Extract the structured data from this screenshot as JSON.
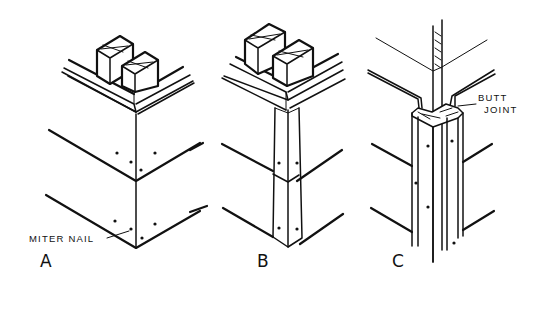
{
  "figure": {
    "type": "technical-illustration"
  },
  "panels": [
    {
      "id": "A",
      "label": "A",
      "callout": "MITER NAIL"
    },
    {
      "id": "B",
      "label": "B"
    },
    {
      "id": "C",
      "label": "C",
      "callout_line1": "BUTT",
      "callout_line2": "JOINT"
    }
  ],
  "colors": {
    "ink": "#111111",
    "paper": "#ffffff"
  }
}
